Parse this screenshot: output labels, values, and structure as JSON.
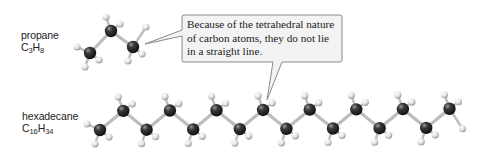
{
  "molecules": [
    {
      "name": "propane",
      "formula": {
        "element1": "C",
        "sub1": "3",
        "element2": "H",
        "sub2": "8"
      },
      "carbon_count": 3
    },
    {
      "name": "hexadecane",
      "formula": {
        "element1": "C",
        "sub1": "16",
        "element2": "H",
        "sub2": "34"
      },
      "carbon_count": 16
    }
  ],
  "callout": {
    "text": "Because of the tetrahedral nature of carbon atoms, they do not lie in a straight line."
  },
  "colors": {
    "carbon": "#2a2a2a",
    "hydrogen": "#e8e8e8",
    "bond": "#bdbdbd",
    "callout_fill": "#f3f3f3",
    "callout_border": "#8a8a8a"
  }
}
